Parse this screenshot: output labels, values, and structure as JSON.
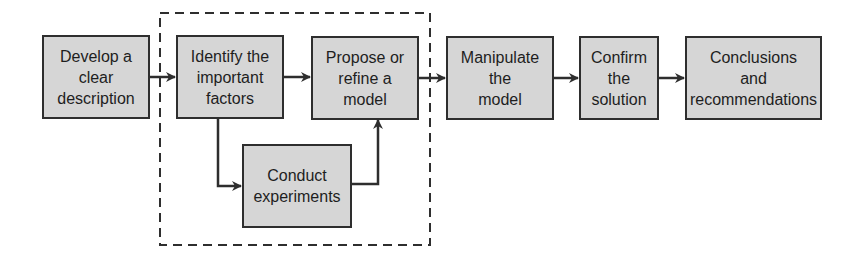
{
  "diagram": {
    "title": "",
    "colors": {
      "box_fill": "#d6d6d6",
      "box_border": "#2e2e2e",
      "text": "#1e1e1e",
      "arrow": "#2e2e2e",
      "group_border": "#2e2e2e"
    },
    "nodes": [
      {
        "id": "develop",
        "label": "Develop a\nclear\ndescription"
      },
      {
        "id": "identify",
        "label": "Identify the\nimportant\nfactors"
      },
      {
        "id": "propose",
        "label": "Propose or\nrefine a\nmodel"
      },
      {
        "id": "manipulate",
        "label": "Manipulate\nthe\nmodel"
      },
      {
        "id": "confirm",
        "label": "Confirm\nthe\nsolution"
      },
      {
        "id": "conclusions",
        "label": "Conclusions\nand\nrecommendations"
      },
      {
        "id": "experiments",
        "label": "Conduct\nexperiments"
      }
    ],
    "edges": [
      {
        "from": "develop",
        "to": "identify"
      },
      {
        "from": "identify",
        "to": "propose"
      },
      {
        "from": "propose",
        "to": "manipulate"
      },
      {
        "from": "manipulate",
        "to": "confirm"
      },
      {
        "from": "confirm",
        "to": "conclusions"
      },
      {
        "from": "identify",
        "to": "experiments"
      },
      {
        "from": "experiments",
        "to": "propose"
      }
    ],
    "groups": [
      {
        "id": "modeling-loop",
        "style": "dashed",
        "contains": [
          "identify",
          "propose",
          "experiments"
        ]
      }
    ]
  }
}
